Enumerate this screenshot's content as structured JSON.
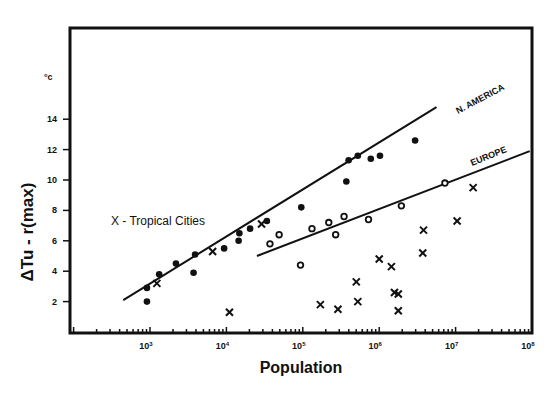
{
  "chart_data": {
    "type": "scatter",
    "title": "",
    "xlabel": "Population",
    "ylabel": "ΔTu - r(max)",
    "yunit": "°C",
    "xscale": "log",
    "xlim": [
      100,
      100000000
    ],
    "ylim": [
      0,
      18
    ],
    "xticks": [
      "10³",
      "10⁴",
      "10⁵",
      "10⁶",
      "10⁷",
      "10⁸"
    ],
    "yticks": [
      "2",
      "4",
      "6",
      "8",
      "10",
      "12",
      "14"
    ],
    "grid": false,
    "legend": "X - Tropical Cities",
    "series": [
      {
        "name": "N. AMERICA",
        "marker": "filled-circle",
        "log10_population": [
          2.96,
          2.96,
          3.12,
          3.34,
          3.57,
          3.59,
          3.97,
          4.16,
          4.17,
          4.31,
          4.53,
          4.98,
          5.57,
          5.6,
          5.72,
          5.89,
          6.01,
          6.47
        ],
        "values": [
          2.0,
          2.9,
          3.8,
          4.5,
          3.9,
          5.1,
          5.5,
          6.0,
          6.5,
          6.8,
          7.3,
          8.2,
          9.9,
          11.3,
          11.6,
          11.4,
          11.6,
          12.6
        ],
        "fit_line": {
          "log10_x": [
            2.65,
            6.75
          ],
          "y": [
            2.1,
            14.8
          ]
        }
      },
      {
        "name": "EUROPE",
        "marker": "open-circle",
        "log10_population": [
          4.57,
          4.69,
          4.97,
          5.12,
          5.34,
          5.43,
          5.54,
          5.86,
          6.29,
          6.86
        ],
        "values": [
          5.8,
          6.4,
          4.4,
          6.8,
          7.2,
          6.4,
          7.6,
          7.4,
          8.3,
          9.8
        ],
        "fit_line": {
          "log10_x": [
            4.4,
            7.97
          ],
          "y": [
            5.0,
            11.9
          ]
        }
      },
      {
        "name": "Tropical Cities",
        "marker": "x",
        "log10_population": [
          3.09,
          3.82,
          4.46,
          4.04,
          5.23,
          5.46,
          5.7,
          5.72,
          6.0,
          6.16,
          6.2,
          6.25,
          6.25,
          6.57,
          6.58,
          7.02,
          7.23
        ],
        "values": [
          3.2,
          5.3,
          7.1,
          1.3,
          1.8,
          1.5,
          3.3,
          2.0,
          4.8,
          4.3,
          2.6,
          2.5,
          1.4,
          5.2,
          6.7,
          7.3,
          9.5
        ]
      }
    ]
  },
  "labels": {
    "y_unit": "°c",
    "y_axis_title": "ΔTu - r(max)",
    "x_axis_title": "Population",
    "legend": "X - Tropical Cities",
    "series_na": "N. AMERICA",
    "series_eu": "EUROPE",
    "xticks": [
      "10",
      "10",
      "10",
      "10",
      "10",
      "10"
    ],
    "xexp": [
      "3",
      "4",
      "5",
      "6",
      "7",
      "8"
    ],
    "yticks": [
      "2",
      "4",
      "6",
      "8",
      "10",
      "12",
      "14"
    ]
  }
}
